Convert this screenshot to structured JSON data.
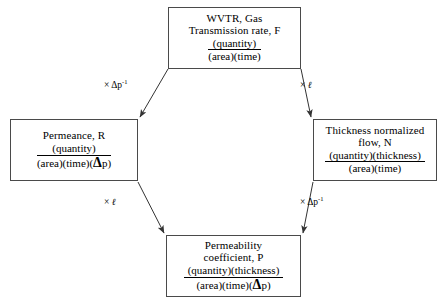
{
  "diagram": {
    "type": "flow-diagram",
    "nodes": [
      {
        "id": "top",
        "name": "wvtr-gas-transmission-rate",
        "title": "WVTR, Gas\nTransmission rate, F",
        "numerator": "(quantity)",
        "denominator": "(area)(time)"
      },
      {
        "id": "left",
        "name": "permeance",
        "title": "Permeance, R",
        "numerator": "(quantity)",
        "denominator_pre": "(area)(time)(",
        "denominator_delta": "Δ",
        "denominator_post": "p)"
      },
      {
        "id": "right",
        "name": "thickness-normalized-flow",
        "title": "Thickness normalized\nflow, N",
        "numerator": "(quantity)(thickness)",
        "denominator": "(area)(time)"
      },
      {
        "id": "bottom",
        "name": "permeability-coefficient",
        "title": "Permeability\ncoefficient, P",
        "numerator": "(quantity)(thickness)",
        "denominator_pre": "(area)(time)(",
        "denominator_delta": "Δ",
        "denominator_post": "p)"
      }
    ],
    "edges": [
      {
        "id": "top-left",
        "from": "top",
        "to": "left",
        "operator": "×",
        "operand": "Δp",
        "exponent": "-1"
      },
      {
        "id": "top-right",
        "from": "top",
        "to": "right",
        "operator": "×",
        "operand": "ℓ",
        "exponent": ""
      },
      {
        "id": "left-bottom",
        "from": "left",
        "to": "bottom",
        "operator": "×",
        "operand": "ℓ",
        "exponent": ""
      },
      {
        "id": "right-bottom",
        "from": "right",
        "to": "bottom",
        "operator": "×",
        "operand": "Δp",
        "exponent": "-1"
      }
    ],
    "colors": {
      "background": "#ffffff",
      "box_border": "#4a4a4a",
      "arrow": "#333333",
      "text": "#000000"
    }
  }
}
